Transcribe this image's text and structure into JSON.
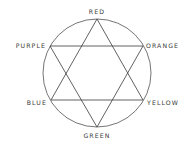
{
  "diagram": {
    "stroke_color": "#3a3a3a",
    "background": "#ffffff",
    "circle": {
      "cx": 97,
      "cy": 73,
      "r": 54
    },
    "vertices": [
      {
        "name": "RED",
        "x": 97,
        "y": 19
      },
      {
        "name": "ORANGE",
        "x": 143,
        "y": 46
      },
      {
        "name": "YELLOW",
        "x": 143,
        "y": 100
      },
      {
        "name": "GREEN",
        "x": 97,
        "y": 127
      },
      {
        "name": "BLUE",
        "x": 51,
        "y": 100
      },
      {
        "name": "PURPLE",
        "x": 50,
        "y": 46
      }
    ],
    "labels": {
      "red": "RED",
      "orange": "ORANGE",
      "yellow": "YELLOW",
      "green": "GREEN",
      "blue": "BLUE",
      "purple": "PURPLE"
    },
    "triangles": [
      {
        "name": "primary",
        "points": [
          "RED",
          "YELLOW",
          "BLUE"
        ]
      },
      {
        "name": "secondary",
        "points": [
          "ORANGE",
          "GREEN",
          "PURPLE"
        ]
      }
    ]
  }
}
